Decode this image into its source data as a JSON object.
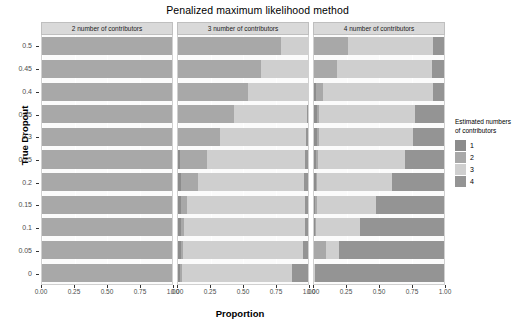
{
  "chart_data": {
    "type": "bar",
    "subtype": "stacked-horizontal-faceted",
    "title": "Penalized maximum likelihood method",
    "xlabel": "Proportion",
    "ylabel": "True Dropout",
    "xlim": [
      0,
      1
    ],
    "xticks": [
      "0.00",
      "0.25",
      "0.50",
      "0.75",
      "1.00"
    ],
    "xtick_values": [
      0,
      0.25,
      0.5,
      0.75,
      1
    ],
    "categories": [
      "0.5",
      "0.45",
      "0.4",
      "0.35",
      "0.3",
      "0.25",
      "0.2",
      "0.15",
      "0.1",
      "0.05",
      "0"
    ],
    "grid": true,
    "legend": {
      "title": "Estimated numbers of contributors",
      "position": "right",
      "entries": [
        {
          "label": "1",
          "color": "#8c8c8c"
        },
        {
          "label": "2",
          "color": "#a8a8a8"
        },
        {
          "label": "3",
          "color": "#cfcfcf"
        },
        {
          "label": "4",
          "color": "#949494"
        }
      ]
    },
    "facet_variable": "number of contributors",
    "facets": [
      {
        "label": "2 number of contributors",
        "series": [
          {
            "name": "1",
            "values": [
              0,
              0,
              0,
              0,
              0,
              0,
              0,
              0,
              0,
              0,
              0
            ]
          },
          {
            "name": "2",
            "values": [
              1.0,
              1.0,
              1.0,
              1.0,
              1.0,
              1.0,
              1.0,
              1.0,
              1.0,
              1.0,
              1.0
            ]
          },
          {
            "name": "3",
            "values": [
              0,
              0,
              0,
              0,
              0,
              0,
              0,
              0,
              0,
              0,
              0
            ]
          },
          {
            "name": "4",
            "values": [
              0,
              0,
              0,
              0,
              0,
              0,
              0,
              0,
              0,
              0,
              0
            ]
          }
        ]
      },
      {
        "label": "3 number of contributors",
        "series": [
          {
            "name": "1",
            "values": [
              0,
              0,
              0,
              0,
              0,
              0.015,
              0.02,
              0.02,
              0.02,
              0.02,
              0.015
            ]
          },
          {
            "name": "2",
            "values": [
              0.79,
              0.64,
              0.54,
              0.43,
              0.32,
              0.205,
              0.135,
              0.05,
              0.03,
              0.02,
              0.015
            ]
          },
          {
            "name": "3",
            "values": [
              0.21,
              0.36,
              0.46,
              0.565,
              0.665,
              0.755,
              0.815,
              0.905,
              0.925,
              0.925,
              0.845
            ]
          },
          {
            "name": "4",
            "values": [
              0,
              0,
              0,
              0.005,
              0.015,
              0.025,
              0.03,
              0.025,
              0.025,
              0.035,
              0.125
            ]
          }
        ]
      },
      {
        "label": "4 number of contributors",
        "series": [
          {
            "name": "1",
            "values": [
              0,
              0,
              0.015,
              0.02,
              0.02,
              0.015,
              0.015,
              0.01,
              0.01,
              0,
              0
            ]
          },
          {
            "name": "2",
            "values": [
              0.26,
              0.18,
              0.055,
              0.015,
              0.015,
              0.015,
              0.01,
              0.01,
              0.005,
              0.095,
              0
            ]
          },
          {
            "name": "3",
            "values": [
              0.655,
              0.73,
              0.845,
              0.745,
              0.725,
              0.67,
              0.575,
              0.455,
              0.34,
              0.095,
              0.01
            ]
          },
          {
            "name": "4",
            "values": [
              0.085,
              0.09,
              0.085,
              0.22,
              0.24,
              0.3,
              0.4,
              0.525,
              0.645,
              0.81,
              0.99
            ]
          }
        ]
      }
    ]
  }
}
